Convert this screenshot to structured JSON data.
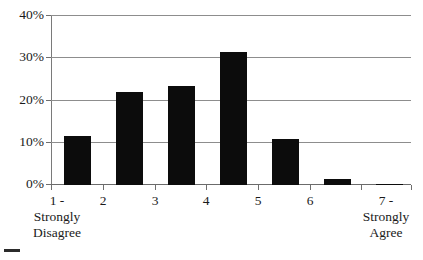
{
  "chart_data": {
    "type": "bar",
    "title": "",
    "subtitle": "",
    "xlabel": "",
    "ylabel": "",
    "categories": [
      "1 - Strongly Disagree",
      "2",
      "3",
      "4",
      "5",
      "6",
      "7 - Strongly Agree"
    ],
    "category_lines": [
      [
        "1 -",
        "Strongly",
        "Disagree"
      ],
      [
        "2"
      ],
      [
        "3"
      ],
      [
        "4"
      ],
      [
        "5"
      ],
      [
        "6"
      ],
      [
        "7 -",
        "Strongly",
        "Agree"
      ]
    ],
    "values": [
      11.5,
      22,
      23.3,
      31.2,
      10.8,
      1.5,
      0.3
    ],
    "value_labels": [
      "11.5%",
      "22%",
      "23.3%",
      "31.2%",
      "10.8%",
      "1.5%",
      "0.3%"
    ],
    "ylim": [
      0,
      40
    ],
    "ytick_values": [
      0,
      10,
      20,
      30,
      40
    ],
    "ytick_labels": [
      "0%",
      "10%",
      "20%",
      "30%",
      "40%"
    ],
    "grid": true,
    "grid_axis": "y",
    "legend": false,
    "legend_position": "none",
    "series": [
      {
        "name": "Response share",
        "values": [
          11.5,
          22,
          23.3,
          31.2,
          10.8,
          1.5,
          0.3
        ]
      }
    ],
    "colors": {
      "bar": "#0c0c0c",
      "grid": "#8d8d8d",
      "axis": "#6f6f6f",
      "background": "#ffffff",
      "text": "#1a1a1a"
    }
  }
}
